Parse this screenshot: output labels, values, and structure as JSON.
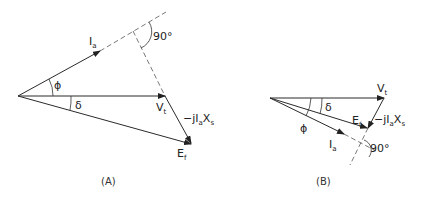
{
  "diagrams": [
    {
      "id": "A",
      "caption": "(A)",
      "labels": {
        "current": "I",
        "current_sub": "a",
        "terminal_voltage": "V",
        "terminal_voltage_sub": "t",
        "emf": "E",
        "emf_sub": "f",
        "drop": "−jI",
        "drop_sub1": "a",
        "drop_x": "X",
        "drop_sub2": "s",
        "phi": "ϕ",
        "delta": "δ",
        "right_angle": "90°"
      }
    },
    {
      "id": "B",
      "caption": "(B)",
      "labels": {
        "current": "I",
        "current_sub": "a",
        "terminal_voltage": "V",
        "terminal_voltage_sub": "t",
        "emf": "E",
        "emf_sub": "f",
        "drop": "−jI",
        "drop_sub1": "a",
        "drop_x": "X",
        "drop_sub2": "s",
        "phi": "ϕ",
        "delta": "δ",
        "right_angle": "90°"
      }
    }
  ]
}
